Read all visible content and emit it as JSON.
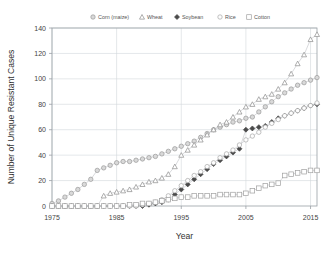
{
  "chart_data": {
    "type": "line",
    "title": "",
    "xlabel": "Year",
    "ylabel": "Number of Unique Resistant Cases",
    "xlim": [
      1975,
      2016
    ],
    "ylim": [
      0,
      140
    ],
    "xticks": [
      1975,
      1985,
      1995,
      2005,
      2015
    ],
    "yticks": [
      0,
      20,
      40,
      60,
      80,
      100,
      120,
      140
    ],
    "grid": true,
    "legend_position": "top-center",
    "legend": [
      "Corn (maize)",
      "Wheat",
      "Soybean",
      "Rice",
      "Cotton"
    ],
    "x": [
      1975,
      1976,
      1977,
      1978,
      1979,
      1980,
      1981,
      1982,
      1983,
      1984,
      1985,
      1986,
      1987,
      1988,
      1989,
      1990,
      1991,
      1992,
      1993,
      1994,
      1995,
      1996,
      1997,
      1998,
      1999,
      2000,
      2001,
      2002,
      2003,
      2004,
      2005,
      2006,
      2007,
      2008,
      2009,
      2010,
      2011,
      2012,
      2013,
      2014,
      2015,
      2016
    ],
    "series": [
      {
        "name": "Corn (maize)",
        "marker": "circle",
        "color": "#9a9a9a",
        "values": [
          2,
          4,
          7,
          10,
          13,
          17,
          21,
          28,
          30,
          32,
          34,
          35,
          35,
          36,
          37,
          38,
          39,
          41,
          43,
          45,
          47,
          49,
          51,
          54,
          57,
          60,
          62,
          64,
          66,
          67,
          69,
          70,
          74,
          78,
          82,
          86,
          89,
          92,
          95,
          97,
          99,
          101
        ]
      },
      {
        "name": "Wheat",
        "marker": "triangle",
        "color": "#8d8d8d",
        "values": [
          0,
          0,
          0,
          0,
          0,
          0,
          0,
          0,
          8,
          10,
          11,
          12,
          13,
          15,
          17,
          19,
          20,
          22,
          25,
          31,
          40,
          44,
          48,
          52,
          56,
          60,
          64,
          66,
          70,
          74,
          78,
          80,
          84,
          86,
          88,
          92,
          97,
          104,
          112,
          119,
          131,
          135
        ]
      },
      {
        "name": "Soybean",
        "marker": "diamond",
        "color": "#4a4a4a",
        "values": [
          0,
          0,
          0,
          0,
          0,
          0,
          0,
          0,
          0,
          0,
          0,
          0,
          0,
          0,
          0,
          1,
          2,
          3,
          5,
          9,
          13,
          17,
          21,
          25,
          29,
          33,
          36,
          39,
          42,
          45,
          60,
          61,
          62,
          63,
          66,
          69,
          71,
          73,
          75,
          77,
          79,
          80
        ]
      },
      {
        "name": "Rice",
        "marker": "circle-open",
        "color": "#a8a8a8",
        "values": [
          0,
          0,
          0,
          0,
          0,
          0,
          0,
          0,
          0,
          0,
          0,
          0,
          0,
          0,
          1,
          2,
          3,
          5,
          8,
          12,
          16,
          20,
          24,
          27,
          31,
          34,
          38,
          41,
          44,
          48,
          52,
          55,
          58,
          62,
          65,
          68,
          71,
          73,
          75,
          77,
          79,
          81
        ]
      },
      {
        "name": "Cotton",
        "marker": "square",
        "color": "#a0a0a0",
        "values": [
          0,
          0,
          0,
          0,
          0,
          0,
          0,
          0,
          0,
          0,
          0,
          0,
          1,
          1,
          2,
          2,
          3,
          4,
          5,
          6,
          7,
          7,
          8,
          8,
          8,
          8,
          9,
          9,
          9,
          9,
          10,
          12,
          14,
          16,
          17,
          18,
          24,
          25,
          26,
          27,
          28,
          28
        ]
      }
    ]
  }
}
